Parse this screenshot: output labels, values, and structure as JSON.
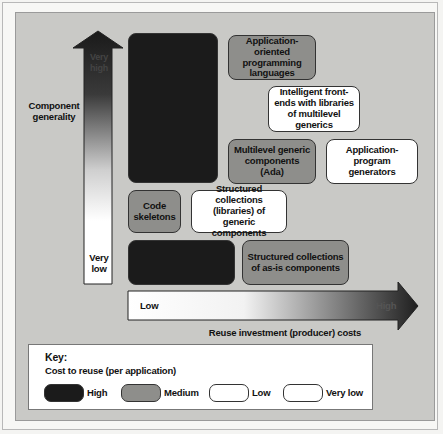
{
  "diagram": {
    "y_axis": {
      "title": "Component generality",
      "top_label": "Very high",
      "bottom_label": "Very low"
    },
    "x_axis": {
      "title": "Reuse investment (producer) costs",
      "left_label": "Low",
      "right_label": "High"
    },
    "boxes": [
      {
        "id": "dark-tall",
        "label": "",
        "cost": "High"
      },
      {
        "id": "app-oriented-languages",
        "label": "Application-oriented programming languages",
        "cost": "Medium"
      },
      {
        "id": "intelligent-front-ends",
        "label": "Intelligent front-ends with libraries of multilevel generics",
        "cost": "Low"
      },
      {
        "id": "multilevel-generic",
        "label": "Multilevel generic components (Ada)",
        "cost": "Medium"
      },
      {
        "id": "app-program-generators",
        "label": "Application-program generators",
        "cost": "Very low"
      },
      {
        "id": "code-skeletons",
        "label": "Code skeletons",
        "cost": "Medium"
      },
      {
        "id": "structured-generic",
        "label": "Structured collections (libraries) of generic components",
        "cost": "Low"
      },
      {
        "id": "dark-bottom",
        "label": "",
        "cost": "High"
      },
      {
        "id": "structured-as-is",
        "label": "Structured collections of as-is components",
        "cost": "Medium"
      }
    ],
    "key": {
      "title": "Key:",
      "subtitle": "Cost to reuse (per application)",
      "items": [
        {
          "label": "High",
          "color": "#1b1b1b"
        },
        {
          "label": "Medium",
          "color": "#8e8e8b"
        },
        {
          "label": "Low",
          "color": "#ffffff"
        },
        {
          "label": "Very low",
          "color": "#ffffff"
        }
      ]
    }
  }
}
